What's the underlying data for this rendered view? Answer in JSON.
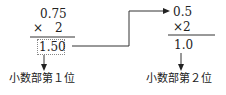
{
  "left": {
    "multiplicand": "0.75",
    "times_sign": "×",
    "multiplier": "2",
    "product": "1.50",
    "label": "小数部第１位"
  },
  "right": {
    "multiplicand": "0.5",
    "times_sign": "×",
    "multiplier": "2",
    "product": "1.0",
    "label": "小数部第２位"
  },
  "colors": {
    "text": "#222222",
    "line": "#333333",
    "box": "#888888"
  }
}
